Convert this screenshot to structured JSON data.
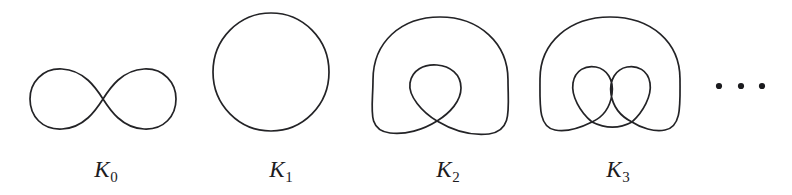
{
  "figure": {
    "kind": "mathematical-diagram",
    "background_color": "#ffffff",
    "stroke_color": "#232326",
    "label_color": "#1c1c1f",
    "panels": [
      {
        "id": "k0",
        "label_base": "K",
        "label_sub": "0",
        "label_text": "K0",
        "shape": "figure-eight",
        "loops": 2,
        "crossings": 1,
        "label_x": 106,
        "label_y": 158
      },
      {
        "id": "k1",
        "label_base": "K",
        "label_sub": "1",
        "label_text": "K1",
        "shape": "circle",
        "loops": 1,
        "crossings": 0,
        "label_x": 281,
        "label_y": 158
      },
      {
        "id": "k2",
        "label_base": "K",
        "label_sub": "2",
        "label_text": "K2",
        "shape": "circle-with-one-inner-loop",
        "loops": 2,
        "crossings": 1,
        "label_x": 448,
        "label_y": 158
      },
      {
        "id": "k3",
        "label_base": "K",
        "label_sub": "3",
        "label_text": "K3",
        "shape": "circle-with-two-inner-loops",
        "loops": 3,
        "crossings": 2,
        "label_x": 618,
        "label_y": 158
      }
    ],
    "ellipsis": {
      "name": "continuation-ellipsis",
      "dot_count": 3,
      "dot_radius": 3.1,
      "dots_x": [
        719,
        741,
        762
      ],
      "dots_y": 86
    }
  }
}
